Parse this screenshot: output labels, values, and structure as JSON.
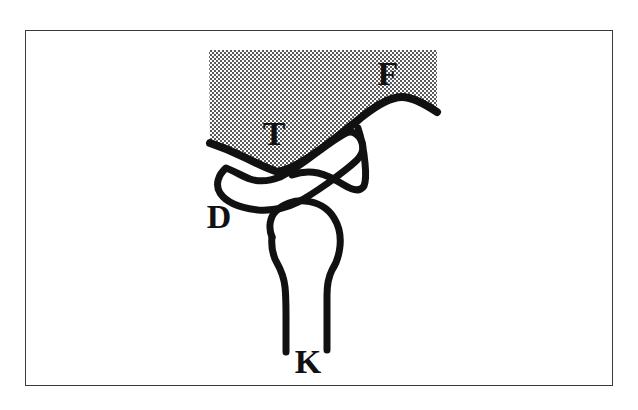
{
  "figure": {
    "background_color": "#ffffff",
    "frame_color": "#3a3a3a",
    "ink_color": "#111111",
    "shade_color": "#8f8f8f",
    "shade_pattern": "checkerboard-dither"
  },
  "labels": {
    "fossa": "F",
    "tubercle": "T",
    "disc": "D",
    "condyle": "K"
  },
  "structures": [
    {
      "key": "temporal-bone",
      "label": "F",
      "shaded": true
    },
    {
      "key": "articular-tubercle",
      "label": "T",
      "shaded": true
    },
    {
      "key": "articular-disc",
      "label": "D",
      "shaded": false
    },
    {
      "key": "mandibular-condyle",
      "label": "K",
      "shaded": false
    }
  ]
}
